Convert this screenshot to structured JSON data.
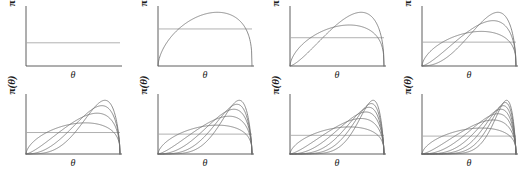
{
  "figure": {
    "title": "",
    "rows": 2,
    "cols": 4,
    "axis_color": "#4d4d4d",
    "curve_color": "#6e6e6e",
    "prior_line_color": "#a8a8a8",
    "background": "#ffffff"
  },
  "labels": {
    "ylabel": "π(θ)",
    "ylabel_pi": "π",
    "ylabel_paren_open": "(",
    "ylabel_theta": "θ",
    "ylabel_paren_close": ")",
    "xlabel": "θ"
  },
  "chart_data": {
    "type": "line",
    "title": "",
    "xlabel": "θ",
    "ylabel": "π(θ)",
    "xlim": [
      0,
      1
    ],
    "ylim": [
      0,
      1
    ],
    "grid": false,
    "legend": "none",
    "prior_line": {
      "name": "uniform prior",
      "y": 0.4,
      "x_from": 0,
      "x_to": 1
    },
    "panels": [
      {
        "index": 1,
        "row": 1,
        "col": 1,
        "n_curves": 0,
        "curves": []
      },
      {
        "index": 2,
        "row": 1,
        "col": 2,
        "n_curves": 1,
        "curves": [
          {
            "name": "posterior 1",
            "alpha": 1.6,
            "beta": 1.35,
            "peak_x": 0.62,
            "peak_y": 0.58
          }
        ]
      },
      {
        "index": 3,
        "row": 1,
        "col": 3,
        "n_curves": 2,
        "curves": [
          {
            "name": "posterior 1",
            "alpha": 1.6,
            "beta": 1.35,
            "peak_x": 0.62,
            "peak_y": 0.58
          },
          {
            "name": "posterior 2",
            "alpha": 2.4,
            "beta": 1.45,
            "peak_x": 0.72,
            "peak_y": 0.76
          }
        ]
      },
      {
        "index": 4,
        "row": 1,
        "col": 4,
        "n_curves": 3,
        "curves": [
          {
            "name": "posterior 1",
            "alpha": 1.6,
            "beta": 1.35,
            "peak_x": 0.62,
            "peak_y": 0.58
          },
          {
            "name": "posterior 2",
            "alpha": 2.4,
            "beta": 1.45,
            "peak_x": 0.72,
            "peak_y": 0.76
          },
          {
            "name": "posterior 3",
            "alpha": 3.3,
            "beta": 1.55,
            "peak_x": 0.78,
            "peak_y": 0.9
          }
        ]
      },
      {
        "index": 5,
        "row": 2,
        "col": 1,
        "n_curves": 4,
        "curves": [
          {
            "name": "posterior 1",
            "alpha": 1.6,
            "beta": 1.35,
            "peak_x": 0.62,
            "peak_y": 0.58
          },
          {
            "name": "posterior 2",
            "alpha": 2.4,
            "beta": 1.45,
            "peak_x": 0.72,
            "peak_y": 0.76
          },
          {
            "name": "posterior 3",
            "alpha": 3.3,
            "beta": 1.55,
            "peak_x": 0.78,
            "peak_y": 0.9
          },
          {
            "name": "posterior 4",
            "alpha": 4.4,
            "beta": 1.65,
            "peak_x": 0.82,
            "peak_y": 1.0
          }
        ]
      },
      {
        "index": 6,
        "row": 2,
        "col": 2,
        "n_curves": 5,
        "curves": [
          {
            "name": "posterior 1",
            "alpha": 1.6,
            "beta": 1.35,
            "peak_x": 0.62,
            "peak_y": 0.58
          },
          {
            "name": "posterior 2",
            "alpha": 2.4,
            "beta": 1.45,
            "peak_x": 0.72,
            "peak_y": 0.76
          },
          {
            "name": "posterior 3",
            "alpha": 3.3,
            "beta": 1.55,
            "peak_x": 0.78,
            "peak_y": 0.9
          },
          {
            "name": "posterior 4",
            "alpha": 4.4,
            "beta": 1.65,
            "peak_x": 0.82,
            "peak_y": 1.0
          },
          {
            "name": "posterior 5",
            "alpha": 5.6,
            "beta": 1.72,
            "peak_x": 0.85,
            "peak_y": 1.08
          }
        ]
      },
      {
        "index": 7,
        "row": 2,
        "col": 3,
        "n_curves": 6,
        "curves": [
          {
            "name": "posterior 1",
            "alpha": 1.6,
            "beta": 1.35,
            "peak_x": 0.62,
            "peak_y": 0.58
          },
          {
            "name": "posterior 2",
            "alpha": 2.4,
            "beta": 1.45,
            "peak_x": 0.72,
            "peak_y": 0.76
          },
          {
            "name": "posterior 3",
            "alpha": 3.3,
            "beta": 1.55,
            "peak_x": 0.78,
            "peak_y": 0.9
          },
          {
            "name": "posterior 4",
            "alpha": 4.4,
            "beta": 1.65,
            "peak_x": 0.82,
            "peak_y": 1.0
          },
          {
            "name": "posterior 5",
            "alpha": 5.6,
            "beta": 1.72,
            "peak_x": 0.85,
            "peak_y": 1.08
          },
          {
            "name": "posterior 6",
            "alpha": 7.0,
            "beta": 1.78,
            "peak_x": 0.87,
            "peak_y": 1.15
          }
        ]
      },
      {
        "index": 8,
        "row": 2,
        "col": 4,
        "n_curves": 7,
        "curves": [
          {
            "name": "posterior 1",
            "alpha": 1.6,
            "beta": 1.35,
            "peak_x": 0.62,
            "peak_y": 0.58
          },
          {
            "name": "posterior 2",
            "alpha": 2.4,
            "beta": 1.45,
            "peak_x": 0.72,
            "peak_y": 0.76
          },
          {
            "name": "posterior 3",
            "alpha": 3.3,
            "beta": 1.55,
            "peak_x": 0.78,
            "peak_y": 0.9
          },
          {
            "name": "posterior 4",
            "alpha": 4.4,
            "beta": 1.65,
            "peak_x": 0.82,
            "peak_y": 1.0
          },
          {
            "name": "posterior 5",
            "alpha": 5.6,
            "beta": 1.72,
            "peak_x": 0.85,
            "peak_y": 1.08
          },
          {
            "name": "posterior 6",
            "alpha": 7.0,
            "beta": 1.78,
            "peak_x": 0.87,
            "peak_y": 1.15
          },
          {
            "name": "posterior 7",
            "alpha": 8.6,
            "beta": 1.84,
            "peak_x": 0.89,
            "peak_y": 1.2
          }
        ]
      }
    ]
  }
}
